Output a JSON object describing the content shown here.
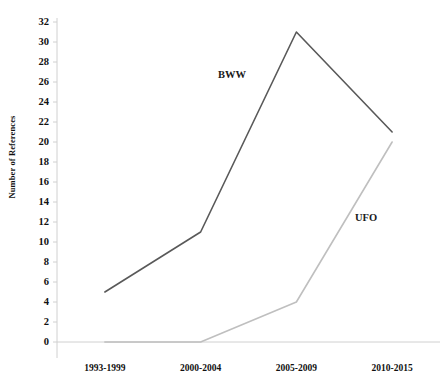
{
  "chart_data": {
    "type": "line",
    "title": "",
    "subtitle": "",
    "xlabel": "",
    "ylabel": "Number of References",
    "categories": [
      "1993-1999",
      "2000-2004",
      "2005-2009",
      "2010-2015"
    ],
    "series": [
      {
        "name": "BWW",
        "values": [
          5,
          11,
          31,
          21
        ],
        "color": "#595959"
      },
      {
        "name": "UFO",
        "values": [
          0,
          0,
          4,
          20
        ],
        "color": "#bfbfbf"
      }
    ],
    "ylim": [
      0,
      32
    ],
    "ytick_step": 2,
    "ytick_labels": [
      "0",
      "2",
      "4",
      "6",
      "8",
      "10",
      "12",
      "14",
      "16",
      "18",
      "20",
      "22",
      "24",
      "26",
      "28",
      "30",
      "32"
    ],
    "grid": false,
    "legend": "inline-annotations",
    "annotations": [
      {
        "text": "BWW",
        "series": "BWW"
      },
      {
        "text": "UFO",
        "series": "UFO"
      }
    ],
    "axis_color": "#d0d0d0",
    "baseline_color": "#d0d0d0"
  }
}
